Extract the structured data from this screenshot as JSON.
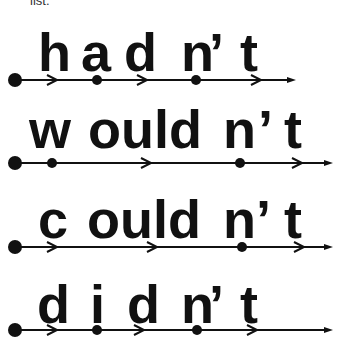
{
  "header_fragment": "list.",
  "rows": [
    {
      "word": "hadn't",
      "segments": [
        {
          "text": "h",
          "x": 38
        },
        {
          "text": "a",
          "x": 81
        },
        {
          "text": "d",
          "x": 124
        },
        {
          "text": "n",
          "x": 181
        },
        {
          "text": "’",
          "x": 209
        },
        {
          "text": "t",
          "x": 240
        }
      ],
      "text_baseline": 65,
      "line_y": 80,
      "line_end": 296,
      "start_dot": 15,
      "dots": [
        97,
        196
      ],
      "chevrons": [
        53,
        143,
        257
      ]
    },
    {
      "word": "wouldn't",
      "segments": [
        {
          "text": "w",
          "x": 29
        },
        {
          "text": "ould",
          "x": 88
        },
        {
          "text": "n",
          "x": 223
        },
        {
          "text": "’",
          "x": 258
        },
        {
          "text": "t",
          "x": 284
        }
      ],
      "text_baseline": 142,
      "line_y": 163,
      "line_end": 333,
      "start_dot": 15,
      "dots": [
        52,
        240
      ],
      "chevrons": [
        147,
        298
      ]
    },
    {
      "word": "couldn't",
      "segments": [
        {
          "text": "c",
          "x": 38
        },
        {
          "text": "ould",
          "x": 87
        },
        {
          "text": "n",
          "x": 223
        },
        {
          "text": "’",
          "x": 256
        },
        {
          "text": "t",
          "x": 284
        }
      ],
      "text_baseline": 232,
      "line_y": 247,
      "line_end": 333,
      "start_dot": 15,
      "dots": [
        242
      ],
      "chevrons": [
        53,
        153,
        300
      ]
    },
    {
      "word": "didn't",
      "segments": [
        {
          "text": "d",
          "x": 37
        },
        {
          "text": "i",
          "x": 90
        },
        {
          "text": "d",
          "x": 127
        },
        {
          "text": "n",
          "x": 181
        },
        {
          "text": "’",
          "x": 209
        },
        {
          "text": "t",
          "x": 240
        }
      ],
      "text_baseline": 317,
      "line_y": 330,
      "line_end": 333,
      "start_dot": 15,
      "dots": [
        97,
        197
      ],
      "chevrons": [
        53,
        140,
        253
      ]
    }
  ],
  "colors": {
    "ink": "#111111",
    "background": "#ffffff"
  }
}
